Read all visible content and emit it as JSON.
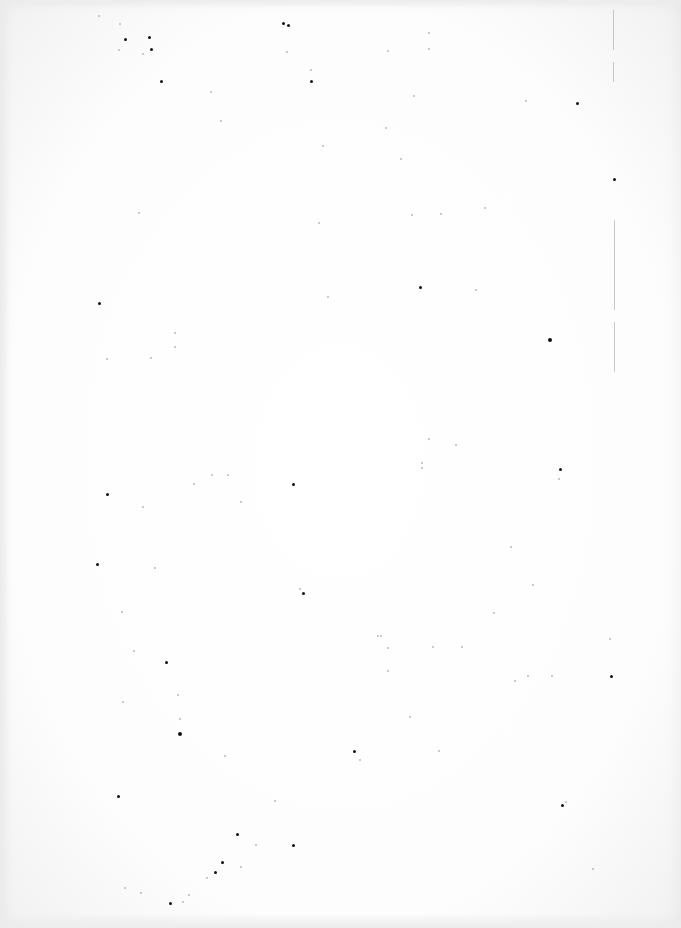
{
  "page": {
    "kind": "blank scanned page",
    "text_content": "",
    "background_color": "#ffffff",
    "speck_color": "#111111",
    "margin_line_color": "#9a9a9a"
  },
  "margin_lines": [
    {
      "x": 613,
      "y": 10,
      "h": 40
    },
    {
      "x": 613,
      "y": 62,
      "h": 20
    },
    {
      "x": 614,
      "y": 220,
      "h": 90
    },
    {
      "x": 614,
      "y": 322,
      "h": 50
    }
  ],
  "specks": [
    {
      "x": 98,
      "y": 15,
      "s": 2
    },
    {
      "x": 119,
      "y": 23,
      "s": 2
    },
    {
      "x": 124,
      "y": 38,
      "s": 3
    },
    {
      "x": 148,
      "y": 36,
      "s": 3
    },
    {
      "x": 150,
      "y": 48,
      "s": 3
    },
    {
      "x": 142,
      "y": 53,
      "s": 2
    },
    {
      "x": 118,
      "y": 49,
      "s": 2
    },
    {
      "x": 160,
      "y": 80,
      "s": 3
    },
    {
      "x": 282,
      "y": 22,
      "s": 3
    },
    {
      "x": 287,
      "y": 24,
      "s": 3
    },
    {
      "x": 286,
      "y": 51,
      "s": 2
    },
    {
      "x": 310,
      "y": 69,
      "s": 2
    },
    {
      "x": 310,
      "y": 80,
      "s": 3
    },
    {
      "x": 210,
      "y": 91,
      "s": 2
    },
    {
      "x": 220,
      "y": 120,
      "s": 2
    },
    {
      "x": 138,
      "y": 212,
      "s": 2
    },
    {
      "x": 98,
      "y": 302,
      "s": 3
    },
    {
      "x": 174,
      "y": 332,
      "s": 2
    },
    {
      "x": 322,
      "y": 145,
      "s": 2
    },
    {
      "x": 318,
      "y": 222,
      "s": 2
    },
    {
      "x": 327,
      "y": 296,
      "s": 2
    },
    {
      "x": 387,
      "y": 50,
      "s": 2
    },
    {
      "x": 428,
      "y": 32,
      "s": 2
    },
    {
      "x": 428,
      "y": 48,
      "s": 2
    },
    {
      "x": 400,
      "y": 158,
      "s": 2
    },
    {
      "x": 385,
      "y": 127,
      "s": 2
    },
    {
      "x": 411,
      "y": 214,
      "s": 2
    },
    {
      "x": 525,
      "y": 100,
      "s": 2
    },
    {
      "x": 475,
      "y": 289,
      "s": 2
    },
    {
      "x": 576,
      "y": 102,
      "s": 3
    },
    {
      "x": 419,
      "y": 286,
      "s": 3
    },
    {
      "x": 548,
      "y": 338,
      "s": 4
    },
    {
      "x": 613,
      "y": 178,
      "s": 3
    },
    {
      "x": 484,
      "y": 207,
      "s": 2
    },
    {
      "x": 440,
      "y": 213,
      "s": 2
    },
    {
      "x": 413,
      "y": 95,
      "s": 2
    },
    {
      "x": 106,
      "y": 358,
      "s": 2
    },
    {
      "x": 150,
      "y": 357,
      "s": 2
    },
    {
      "x": 174,
      "y": 346,
      "s": 2
    },
    {
      "x": 227,
      "y": 474,
      "s": 2
    },
    {
      "x": 211,
      "y": 474,
      "s": 2
    },
    {
      "x": 193,
      "y": 483,
      "s": 2
    },
    {
      "x": 106,
      "y": 493,
      "s": 3
    },
    {
      "x": 142,
      "y": 506,
      "s": 2
    },
    {
      "x": 240,
      "y": 501,
      "s": 2
    },
    {
      "x": 292,
      "y": 483,
      "s": 3
    },
    {
      "x": 96,
      "y": 563,
      "s": 3
    },
    {
      "x": 302,
      "y": 592,
      "s": 3
    },
    {
      "x": 121,
      "y": 611,
      "s": 2
    },
    {
      "x": 154,
      "y": 567,
      "s": 2
    },
    {
      "x": 299,
      "y": 588,
      "s": 2
    },
    {
      "x": 455,
      "y": 444,
      "s": 2
    },
    {
      "x": 428,
      "y": 438,
      "s": 2
    },
    {
      "x": 421,
      "y": 462,
      "s": 2
    },
    {
      "x": 421,
      "y": 467,
      "s": 2
    },
    {
      "x": 559,
      "y": 468,
      "s": 3
    },
    {
      "x": 558,
      "y": 478,
      "s": 2
    },
    {
      "x": 510,
      "y": 546,
      "s": 2
    },
    {
      "x": 493,
      "y": 612,
      "s": 2
    },
    {
      "x": 532,
      "y": 584,
      "s": 2
    },
    {
      "x": 377,
      "y": 635,
      "s": 2
    },
    {
      "x": 432,
      "y": 646,
      "s": 2
    },
    {
      "x": 387,
      "y": 670,
      "s": 2
    },
    {
      "x": 133,
      "y": 650,
      "s": 2
    },
    {
      "x": 165,
      "y": 661,
      "s": 3
    },
    {
      "x": 177,
      "y": 694,
      "s": 2
    },
    {
      "x": 178,
      "y": 732,
      "s": 4
    },
    {
      "x": 179,
      "y": 718,
      "s": 2
    },
    {
      "x": 122,
      "y": 701,
      "s": 2
    },
    {
      "x": 224,
      "y": 755,
      "s": 2
    },
    {
      "x": 117,
      "y": 795,
      "s": 3
    },
    {
      "x": 274,
      "y": 800,
      "s": 2
    },
    {
      "x": 236,
      "y": 833,
      "s": 3
    },
    {
      "x": 255,
      "y": 844,
      "s": 2
    },
    {
      "x": 292,
      "y": 844,
      "s": 3
    },
    {
      "x": 221,
      "y": 861,
      "s": 3
    },
    {
      "x": 214,
      "y": 871,
      "s": 3
    },
    {
      "x": 206,
      "y": 877,
      "s": 2
    },
    {
      "x": 188,
      "y": 894,
      "s": 2
    },
    {
      "x": 182,
      "y": 901,
      "s": 2
    },
    {
      "x": 169,
      "y": 902,
      "s": 3
    },
    {
      "x": 124,
      "y": 887,
      "s": 2
    },
    {
      "x": 140,
      "y": 892,
      "s": 2
    },
    {
      "x": 240,
      "y": 866,
      "s": 2
    },
    {
      "x": 380,
      "y": 635,
      "s": 2
    },
    {
      "x": 387,
      "y": 647,
      "s": 2
    },
    {
      "x": 461,
      "y": 646,
      "s": 2
    },
    {
      "x": 514,
      "y": 680,
      "s": 2
    },
    {
      "x": 527,
      "y": 675,
      "s": 2
    },
    {
      "x": 551,
      "y": 675,
      "s": 2
    },
    {
      "x": 609,
      "y": 638,
      "s": 2
    },
    {
      "x": 610,
      "y": 675,
      "s": 3
    },
    {
      "x": 353,
      "y": 750,
      "s": 3
    },
    {
      "x": 359,
      "y": 759,
      "s": 2
    },
    {
      "x": 409,
      "y": 716,
      "s": 2
    },
    {
      "x": 438,
      "y": 750,
      "s": 2
    },
    {
      "x": 561,
      "y": 804,
      "s": 3
    },
    {
      "x": 565,
      "y": 801,
      "s": 2
    },
    {
      "x": 592,
      "y": 868,
      "s": 2
    }
  ]
}
